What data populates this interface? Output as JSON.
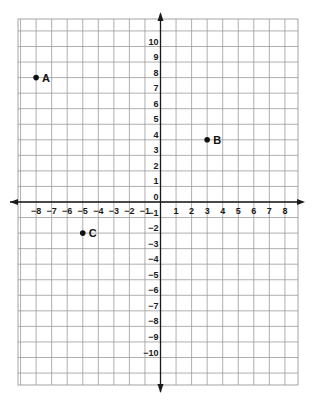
{
  "diagram": {
    "type": "coordinate-plane",
    "x_axis": {
      "min_tick": -8,
      "max_tick": 8,
      "ticks": [
        -8,
        -7,
        -6,
        -5,
        -4,
        -3,
        -2,
        -1,
        1,
        2,
        3,
        4,
        5,
        6,
        7,
        8
      ]
    },
    "y_axis": {
      "min_tick": -10,
      "max_tick": 10,
      "ticks": [
        10,
        9,
        8,
        7,
        6,
        5,
        4,
        3,
        2,
        1,
        0,
        -1,
        -2,
        -3,
        -4,
        -5,
        -6,
        -7,
        -8,
        -9,
        -10
      ]
    },
    "points": [
      {
        "label": "A",
        "x": -8,
        "y": 8
      },
      {
        "label": "B",
        "x": 3,
        "y": 4
      },
      {
        "label": "C",
        "x": -5,
        "y": -2
      }
    ],
    "colors": {
      "grid": "#9a9a9a",
      "axis": "#1a1a1a",
      "point": "#111111"
    }
  }
}
